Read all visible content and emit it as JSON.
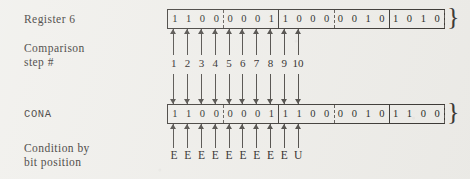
{
  "figure": {
    "background_color": "#efeeea",
    "ink_color": "#2a2724"
  },
  "labels": {
    "register6": "Register 6",
    "comparison_step": "Comparison\nstep #",
    "cona": "CONA",
    "condition": "Condition by\nbit position"
  },
  "registers": [
    {
      "name": "register-6",
      "label": "Register 6",
      "bit_groups": [
        {
          "separator_before": "none",
          "bits": [
            "1",
            "1",
            "0",
            "0"
          ]
        },
        {
          "separator_before": "dash",
          "bits": [
            "0",
            "0",
            "0",
            "1"
          ]
        },
        {
          "separator_before": "solid",
          "bits": [
            "1",
            "0",
            "0",
            "0"
          ]
        },
        {
          "separator_before": "dash",
          "bits": [
            "0",
            "0",
            "1",
            "0"
          ]
        },
        {
          "separator_before": "solid",
          "bits": [
            "1",
            "0",
            "1",
            "0"
          ]
        }
      ],
      "continuation": "}"
    },
    {
      "name": "cona",
      "label": "CONA",
      "bit_groups": [
        {
          "separator_before": "none",
          "bits": [
            "1",
            "1",
            "0",
            "0"
          ]
        },
        {
          "separator_before": "dash",
          "bits": [
            "0",
            "0",
            "0",
            "1"
          ]
        },
        {
          "separator_before": "solid",
          "bits": [
            "1",
            "1",
            "0",
            "0"
          ]
        },
        {
          "separator_before": "dash",
          "bits": [
            "0",
            "0",
            "1",
            "0"
          ]
        },
        {
          "separator_before": "solid",
          "bits": [
            "1",
            "1",
            "0",
            "0"
          ]
        }
      ],
      "continuation": "}"
    }
  ],
  "steps": [
    "1",
    "2",
    "3",
    "4",
    "5",
    "6",
    "7",
    "8",
    "9",
    "10"
  ],
  "conditions": [
    "E",
    "E",
    "E",
    "E",
    "E",
    "E",
    "E",
    "E",
    "E",
    "U"
  ],
  "chart_data": {
    "type": "table",
    "rows": [
      {
        "name": "Register 6",
        "bits": [
          "1",
          "1",
          "0",
          "0",
          "0",
          "0",
          "0",
          "1",
          "1",
          "0",
          "0",
          "0",
          "0",
          "0",
          "1",
          "0",
          "1",
          "0",
          "1",
          "0"
        ]
      },
      {
        "name": "CONA",
        "bits": [
          "1",
          "1",
          "0",
          "0",
          "0",
          "0",
          "0",
          "1",
          "1",
          "1",
          "0",
          "0",
          "0",
          "0",
          "1",
          "0",
          "1",
          "1",
          "0",
          "0"
        ]
      }
    ],
    "compared_positions": 10,
    "step_labels": [
      "1",
      "2",
      "3",
      "4",
      "5",
      "6",
      "7",
      "8",
      "9",
      "10"
    ],
    "condition_per_step": [
      "E",
      "E",
      "E",
      "E",
      "E",
      "E",
      "E",
      "E",
      "E",
      "U"
    ],
    "legend": {
      "E": "equal",
      "U": "unequal"
    }
  }
}
